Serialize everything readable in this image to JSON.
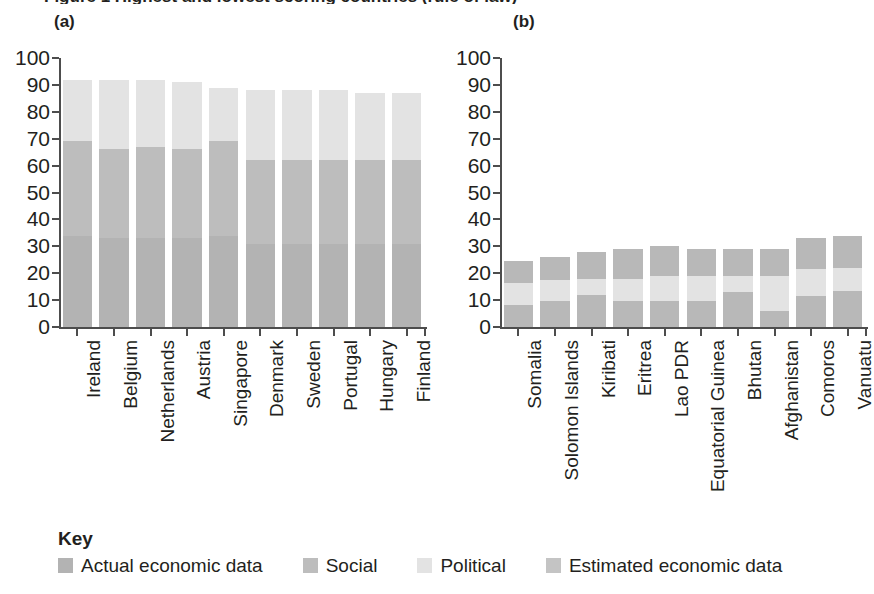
{
  "figure": {
    "title_cutoff": "Figure 1  Highest and lowest scoring countries (rule of law)",
    "key_title": "Key"
  },
  "legend": {
    "items": [
      {
        "label": "Actual economic data",
        "color": "#b3b3b3"
      },
      {
        "label": "Social",
        "color": "#bdbdbd"
      },
      {
        "label": "Political",
        "color": "#e3e3e3"
      },
      {
        "label": "Estimated economic data",
        "color": "#c4c4c4"
      }
    ]
  },
  "axis": {
    "ticks": [
      0,
      10,
      20,
      30,
      40,
      50,
      60,
      70,
      80,
      90,
      100
    ],
    "ymin": 0,
    "ymax": 100
  },
  "panels": [
    {
      "label": "(a)"
    },
    {
      "label": "(b)"
    }
  ],
  "chart_data": [
    {
      "type": "bar",
      "panel": "(a)",
      "title": "",
      "xlabel": "",
      "ylabel": "",
      "ylim": [
        0,
        100
      ],
      "grid": false,
      "stacked": true,
      "legend_position": "bottom",
      "categories": [
        "Ireland",
        "Belgium",
        "Netherlands",
        "Austria",
        "Singapore",
        "Denmark",
        "Sweden",
        "Portugal",
        "Hungary",
        "Finland"
      ],
      "series": [
        {
          "name": "Actual economic data",
          "color": "#b3b3b3",
          "values": [
            34,
            33,
            33,
            33,
            34,
            31,
            31,
            31,
            31,
            31
          ]
        },
        {
          "name": "Social",
          "color": "#bdbdbd",
          "values": [
            35,
            33,
            34,
            33,
            35,
            31,
            31,
            31,
            31,
            31
          ]
        },
        {
          "name": "Political",
          "color": "#e3e3e3",
          "values": [
            23,
            26,
            25,
            25,
            20,
            26,
            26,
            26,
            25,
            25
          ]
        }
      ],
      "totals": [
        92,
        92,
        92,
        91,
        89,
        88,
        88,
        88,
        87,
        87
      ]
    },
    {
      "type": "bar",
      "panel": "(b)",
      "title": "",
      "xlabel": "",
      "ylabel": "",
      "ylim": [
        0,
        100
      ],
      "grid": false,
      "stacked": true,
      "legend_position": "bottom",
      "categories": [
        "Somalia",
        "Solomon Islands",
        "Kiribati",
        "Eritrea",
        "Lao PDR",
        "Equatorial Guinea",
        "Bhutan",
        "Afghanistan",
        "Comoros",
        "Vanuatu"
      ],
      "series": [
        {
          "name": "Actual economic data",
          "color": "#b8b8b8",
          "values": [
            8,
            9.5,
            12,
            9.5,
            9.5,
            9.5,
            13,
            6,
            11.5,
            13.5
          ]
        },
        {
          "name": "Political",
          "color": "#e3e3e3",
          "values": [
            8.5,
            8,
            6,
            8.5,
            9.5,
            9.5,
            6,
            13,
            10,
            8.5
          ]
        },
        {
          "name": "Estimated economic data",
          "color": "#b8b8b8",
          "values": [
            8,
            8.5,
            10,
            11,
            11,
            10,
            10,
            10,
            11.5,
            12
          ]
        }
      ],
      "totals": [
        24.5,
        26,
        28,
        29,
        30,
        29,
        29,
        29,
        33,
        34
      ]
    }
  ]
}
